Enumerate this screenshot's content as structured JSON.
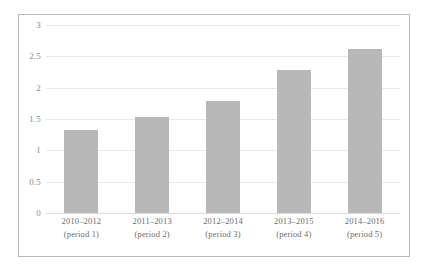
{
  "chart_data": {
    "type": "bar",
    "title": "",
    "subtitle": "",
    "xlabel": "",
    "ylabel": "",
    "categories": [
      "2010–2012",
      "2011–2013",
      "2012–2014",
      "2013–2015",
      "2014–2016"
    ],
    "category_sublabels": [
      "(period 1)",
      "(period 2)",
      "(period 3)",
      "(period 4)",
      "(period 5)"
    ],
    "values": [
      1.32,
      1.54,
      1.79,
      2.28,
      2.61
    ],
    "ylim": [
      0,
      3
    ],
    "ytick_labels": [
      "0",
      "0.5",
      "1",
      "1.5",
      "2",
      "2.5",
      "3"
    ],
    "ytick_values": [
      0,
      0.5,
      1,
      1.5,
      2,
      2.5,
      3
    ],
    "grid": "horizontal",
    "legend": "none",
    "bar_color": "#b8b8b8",
    "grid_color": "#e9e9e9",
    "frame_color": "#b9b9b9",
    "tick_label_color": "#8a8a8a",
    "category_label_color": "#6d6d6d",
    "background_color": "#ffffff"
  }
}
